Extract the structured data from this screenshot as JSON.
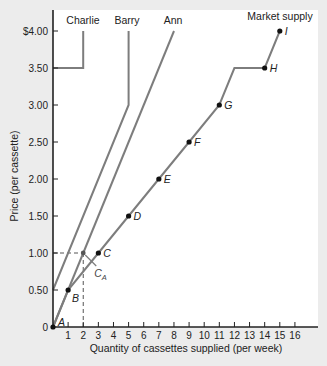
{
  "chart_data": {
    "type": "line",
    "title": "",
    "xlabel": "Quantity of cassettes supplied (per week)",
    "ylabel": "Price (per cassette)",
    "xlim": [
      0,
      16
    ],
    "ylim": [
      0,
      4.0
    ],
    "x_ticks": [
      "1",
      "2",
      "3",
      "4",
      "5",
      "6",
      "7",
      "8",
      "9",
      "10",
      "11",
      "12",
      "13",
      "14",
      "15",
      "16"
    ],
    "y_ticks": [
      {
        "value": 0,
        "label": "0"
      },
      {
        "value": 0.5,
        "label": "0.50"
      },
      {
        "value": 1.0,
        "label": "1.00"
      },
      {
        "value": 1.5,
        "label": "1.50"
      },
      {
        "value": 2.0,
        "label": "2.00"
      },
      {
        "value": 2.5,
        "label": "2.50"
      },
      {
        "value": 3.0,
        "label": "3.00"
      },
      {
        "value": 3.5,
        "label": "3.50"
      },
      {
        "value": 4.0,
        "label": "$4.00"
      }
    ],
    "grid": false,
    "series": [
      {
        "name": "Charlie",
        "points": [
          [
            0,
            3.5
          ],
          [
            2,
            3.5
          ],
          [
            2,
            4.0
          ]
        ]
      },
      {
        "name": "Barry",
        "points": [
          [
            0,
            0.5
          ],
          [
            5,
            3.0
          ],
          [
            5,
            4.0
          ]
        ]
      },
      {
        "name": "Ann",
        "points": [
          [
            0,
            0
          ],
          [
            8,
            4.0
          ]
        ]
      },
      {
        "name": "Market supply",
        "points": [
          [
            0,
            0
          ],
          [
            1,
            0.5
          ],
          [
            3,
            1.0
          ],
          [
            5,
            1.5
          ],
          [
            7,
            2.0
          ],
          [
            9,
            2.5
          ],
          [
            11,
            3.0
          ],
          [
            12,
            3.5
          ],
          [
            14,
            3.5
          ],
          [
            15,
            4.0
          ]
        ],
        "labeled_points": [
          {
            "label": "A",
            "x": 0,
            "y": 0
          },
          {
            "label": "B",
            "x": 1,
            "y": 0.5
          },
          {
            "label": "C",
            "x": 3,
            "y": 1.0
          },
          {
            "label": "D",
            "x": 5,
            "y": 1.5
          },
          {
            "label": "E",
            "x": 7,
            "y": 2.0
          },
          {
            "label": "F",
            "x": 9,
            "y": 2.5
          },
          {
            "label": "G",
            "x": 11,
            "y": 3.0
          },
          {
            "label": "H",
            "x": 14,
            "y": 3.5
          },
          {
            "label": "I",
            "x": 15,
            "y": 4.0
          }
        ]
      }
    ],
    "annotations": [
      {
        "label": "C",
        "subscript": "A",
        "x": 2,
        "y": 1.0,
        "note": "Ann's supply at price 1.00"
      }
    ],
    "reference_lines": [
      {
        "type": "dashed-horizontal",
        "y": 1.0,
        "x_from": 0,
        "x_to": 2
      },
      {
        "type": "dashed-vertical",
        "x": 2,
        "y_from": 0,
        "y_to": 1.0
      }
    ],
    "colors": {
      "line": "#7d7d7d",
      "point": "#111111",
      "axis": "#222222",
      "plot_bg": "#ffffff",
      "page_bg": "#ececec"
    }
  }
}
